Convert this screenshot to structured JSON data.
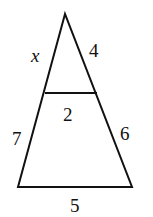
{
  "diagram": {
    "type": "triangle-with-parallel-segment",
    "labels": {
      "upper_left_side": "x",
      "upper_right_side": "4",
      "parallel_segment": "2",
      "lower_left_side": "7",
      "lower_right_side": "6",
      "base": "5"
    },
    "stroke_color": "#111111"
  }
}
